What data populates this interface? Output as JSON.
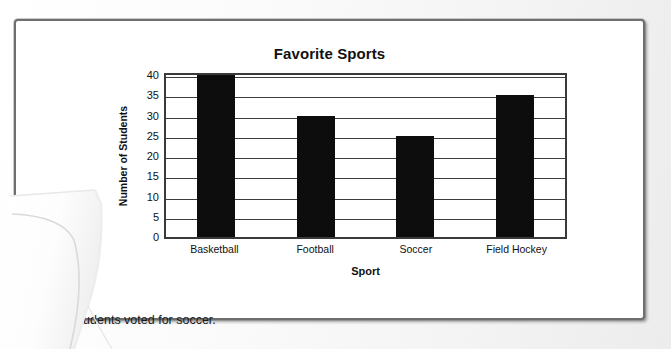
{
  "document": {
    "caption": "25 students voted for soccer."
  },
  "chart_data": {
    "type": "bar",
    "title": "Favorite Sports",
    "xlabel": "Sport",
    "ylabel": "Number of Students",
    "categories": [
      "Basketball",
      "Football",
      "Soccer",
      "Field Hockey"
    ],
    "values": [
      40,
      30,
      25,
      35
    ],
    "ylim": [
      0,
      40
    ],
    "ytick_step": 5,
    "yticks": [
      0,
      5,
      10,
      15,
      20,
      25,
      30,
      35,
      40
    ],
    "grid": true,
    "legend": false,
    "bar_color": "#0d0d0d",
    "axis_color": "#3a3a3a"
  }
}
